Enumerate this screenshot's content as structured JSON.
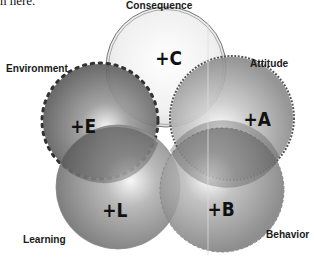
{
  "top_snippet": "n here.",
  "diagram": {
    "circles": [
      {
        "id": "consequence",
        "symbol": "+C",
        "label": "Consequence",
        "border": "double-line"
      },
      {
        "id": "environment",
        "symbol": "+E",
        "label": "Environment",
        "border": "dotted-beads"
      },
      {
        "id": "attitude",
        "symbol": "+A",
        "label": "Attitude",
        "border": "scalloped"
      },
      {
        "id": "learning",
        "symbol": "+L",
        "label": "Learning",
        "border": "plain"
      },
      {
        "id": "behavior",
        "symbol": "+B",
        "label": "Behavior",
        "border": "dashed"
      }
    ]
  },
  "colors": {
    "light_fill": "#f2f2f2",
    "mid_fill": "#9a9a9a",
    "dark_fill": "#555555",
    "text": "#1a1a1a"
  }
}
